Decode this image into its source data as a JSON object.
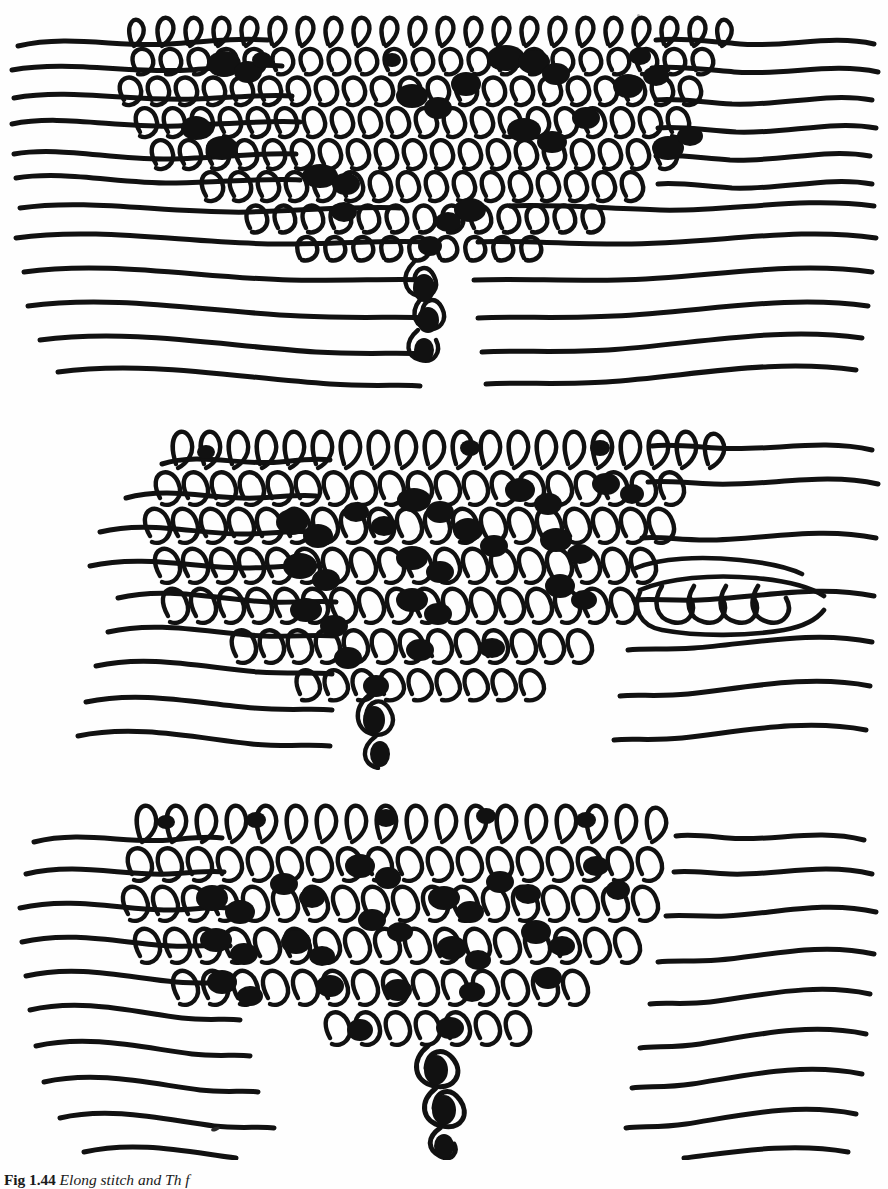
{
  "document": {
    "type": "book-figure-page",
    "background_color": "#ffffff",
    "ink_color": "#111111",
    "page_width": 888,
    "page_height": 1189
  },
  "caption": {
    "figure_number": "Fig 1.44",
    "figure_label_bold": "Fig",
    "figure_number_value": "1.44",
    "text": "Elong stitch and    Th       f",
    "full": "Fig 1.44 Elong stitch and    Th       f",
    "clipped": "bottom-of-page",
    "style": "bold label, italic body"
  },
  "figure": {
    "panel_count": 3,
    "panels": [
      {
        "id": "panel-1",
        "name": "top-knit-diagram",
        "description": "Knitted loop block with elongated stitches, free yarn tails at left and right, single dropped stitch column descending at lower centre",
        "loop_rows": 6,
        "loops_per_row": 22,
        "free_ends_left": 6,
        "free_ends_right": 6,
        "drop_column": true,
        "drop_column_x_ratio": 0.49
      },
      {
        "id": "panel-2",
        "name": "middle-knit-diagram",
        "description": "Knitted loop block with unravelling loop chain running off to the right, free yarn tails left and right, dropped stitch column at lower centre",
        "loop_rows": 6,
        "loops_per_row": 20,
        "free_ends_left": 6,
        "free_ends_right": 5,
        "drop_column": true,
        "drop_column_x_ratio": 0.45,
        "unravel_chain_right": true
      },
      {
        "id": "panel-3",
        "name": "bottom-knit-diagram",
        "description": "Knitted loop block with long dropped stitch ladder descending to the bottom centre where the tails converge",
        "loop_rows": 5,
        "loops_per_row": 18,
        "free_ends_left": 6,
        "free_ends_right": 6,
        "drop_column": true,
        "drop_column_x_ratio": 0.5
      }
    ]
  },
  "artifacts": {
    "ink_speck_label": "scan-ink-speck"
  }
}
